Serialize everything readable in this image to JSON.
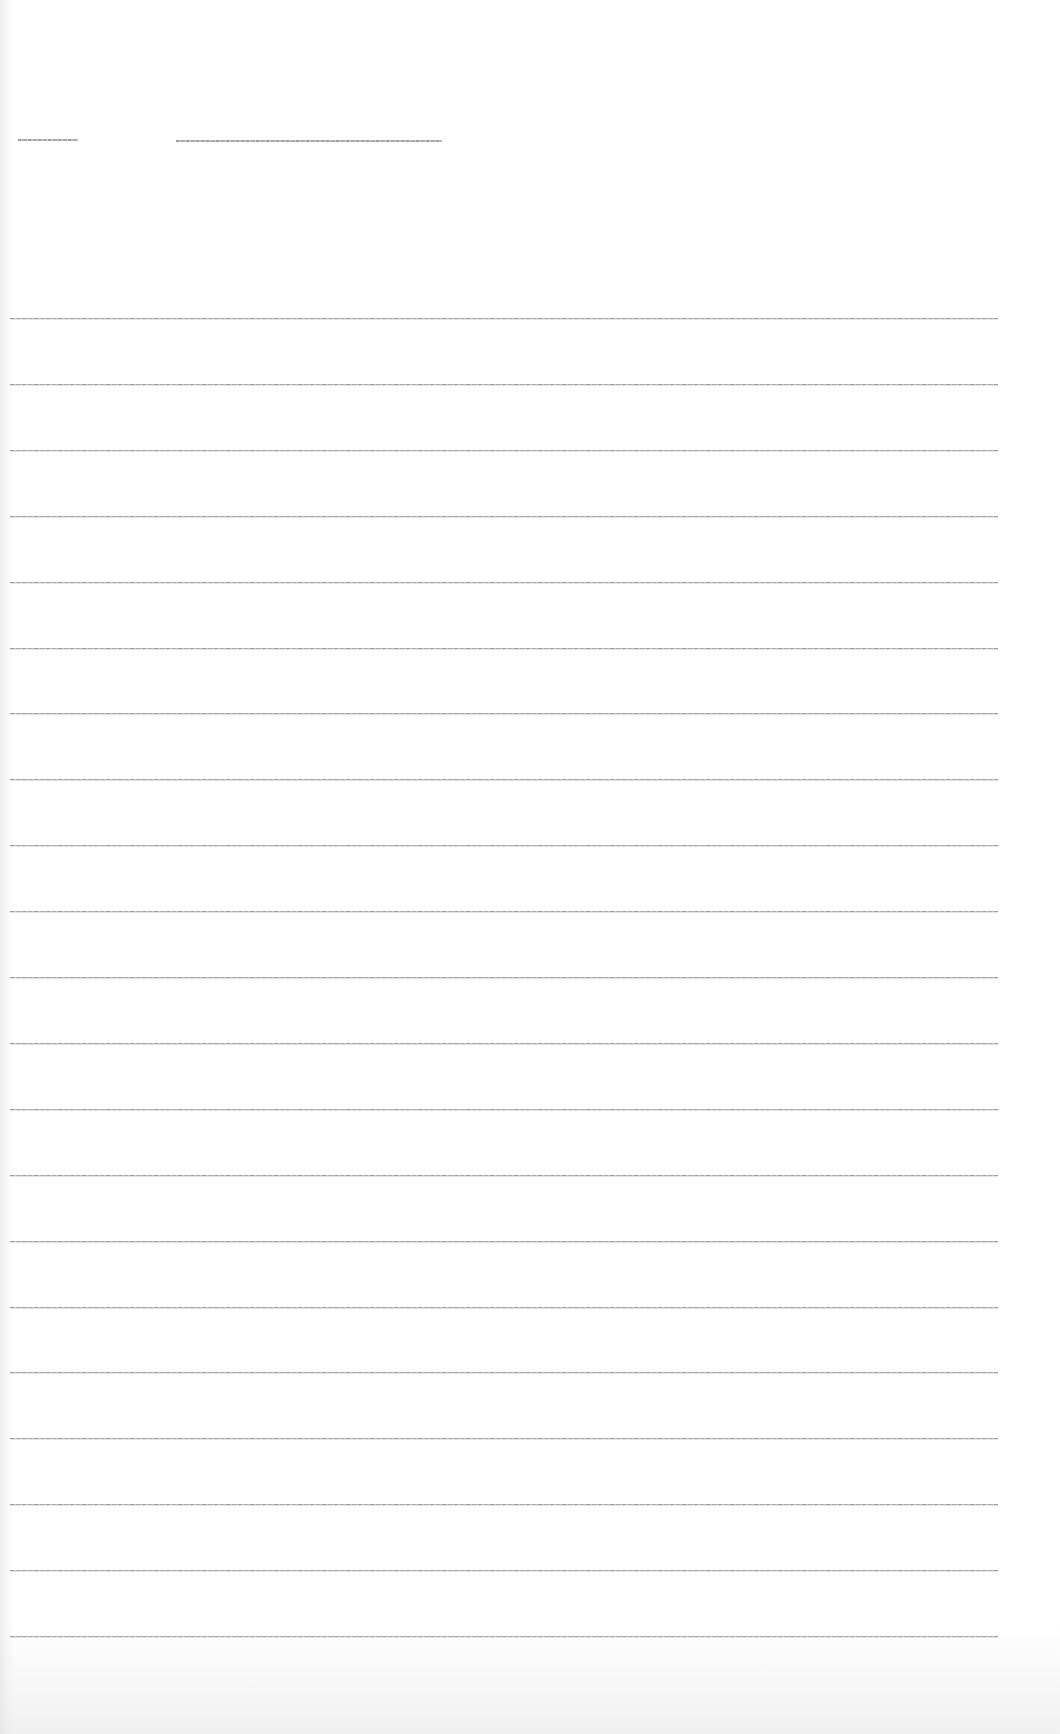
{
  "page": {
    "type": "ruled-paper",
    "background_color": "#ffffff",
    "line_color": "#a0a0a0",
    "header_fields": [
      {
        "name": "field-1",
        "value": ""
      },
      {
        "name": "field-2",
        "value": ""
      }
    ],
    "rule_count": 21,
    "lines": [
      "",
      "",
      "",
      "",
      "",
      "",
      "",
      "",
      "",
      "",
      "",
      "",
      "",
      "",
      "",
      "",
      "",
      "",
      "",
      "",
      ""
    ]
  }
}
